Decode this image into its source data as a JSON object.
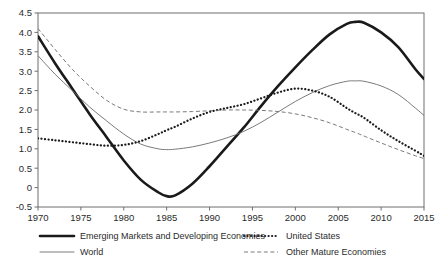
{
  "chart_data": {
    "type": "line",
    "title": "",
    "subtitle": "",
    "xlabel": "",
    "ylabel": "",
    "xlim": [
      1970,
      2015
    ],
    "ylim": [
      -0.5,
      4.5
    ],
    "grid": false,
    "legend_position": "bottom",
    "x_ticks": [
      1970,
      1975,
      1980,
      1985,
      1990,
      1995,
      2000,
      2005,
      2010,
      2015
    ],
    "x_tick_labels": [
      "1970",
      "1975",
      "1980",
      "1985",
      "1990",
      "1995",
      "2000",
      "2005",
      "2010",
      "2015"
    ],
    "y_ticks": [
      -0.5,
      0,
      0.5,
      1.0,
      1.5,
      2.0,
      2.5,
      3.0,
      3.5,
      4.0,
      4.5
    ],
    "y_tick_labels": [
      "-0.5",
      "0",
      "0.5",
      "1.0",
      "1.5",
      "2.0",
      "2.5",
      "3.0",
      "3.5",
      "4.0",
      "4.5"
    ],
    "x": [
      1970,
      1972,
      1974,
      1976,
      1978,
      1980,
      1982,
      1984,
      1985,
      1986,
      1988,
      1990,
      1992,
      1994,
      1996,
      1998,
      2000,
      2002,
      2004,
      2006,
      2007,
      2008,
      2010,
      2012,
      2014,
      2015
    ],
    "series": [
      {
        "name": "Emerging Markets and Developing Economies",
        "style": "thick-solid",
        "color": "#1a1a1a",
        "width": 2.6,
        "values": [
          3.9,
          3.2,
          2.55,
          1.9,
          1.3,
          0.7,
          0.2,
          -0.12,
          -0.22,
          -0.2,
          0.1,
          0.55,
          1.05,
          1.55,
          2.1,
          2.62,
          3.1,
          3.55,
          3.95,
          4.22,
          4.27,
          4.25,
          4.0,
          3.62,
          3.05,
          2.8
        ]
      },
      {
        "name": "World",
        "style": "thin-solid",
        "color": "#6b6b6b",
        "width": 0.9,
        "values": [
          3.4,
          2.92,
          2.5,
          2.08,
          1.72,
          1.38,
          1.12,
          1.0,
          0.98,
          0.99,
          1.05,
          1.15,
          1.28,
          1.45,
          1.68,
          1.95,
          2.22,
          2.45,
          2.63,
          2.74,
          2.75,
          2.74,
          2.62,
          2.4,
          2.05,
          1.86
        ]
      },
      {
        "name": "United States",
        "style": "dotted",
        "color": "#1a1a1a",
        "width": 2.2,
        "values": [
          1.27,
          1.22,
          1.17,
          1.12,
          1.08,
          1.1,
          1.2,
          1.38,
          1.48,
          1.57,
          1.78,
          1.95,
          2.05,
          2.15,
          2.3,
          2.45,
          2.55,
          2.5,
          2.34,
          2.05,
          1.92,
          1.8,
          1.48,
          1.2,
          0.95,
          0.82
        ]
      },
      {
        "name": "Other Mature Economies",
        "style": "dashed",
        "color": "#6b6b6b",
        "width": 0.9,
        "values": [
          4.1,
          3.56,
          3.05,
          2.62,
          2.25,
          2.02,
          1.95,
          1.95,
          1.95,
          1.95,
          1.96,
          1.98,
          2.0,
          2.0,
          1.99,
          1.96,
          1.9,
          1.8,
          1.67,
          1.5,
          1.42,
          1.33,
          1.15,
          0.98,
          0.82,
          0.75
        ]
      }
    ]
  },
  "legend": {
    "items": [
      {
        "label": "Emerging Markets and Developing Economies",
        "style": "thick-solid"
      },
      {
        "label": "World",
        "style": "thin-solid"
      },
      {
        "label": "United States",
        "style": "dotted"
      },
      {
        "label": "Other Mature Economies",
        "style": "dashed"
      }
    ]
  }
}
